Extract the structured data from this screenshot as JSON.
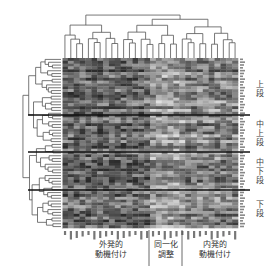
{
  "chart_data": {
    "type": "heatmap",
    "title": "",
    "dendrogram_top": true,
    "dendrogram_left": true,
    "n_columns": 30,
    "n_rows": 60,
    "column_groups": [
      {
        "label": "外発的\n動機付け",
        "span": [
          0,
          15
        ]
      },
      {
        "label": "同一化\n調整",
        "span": [
          15,
          21
        ]
      },
      {
        "label": "内発的\n動機付け",
        "span": [
          21,
          30
        ]
      }
    ],
    "row_segments": [
      {
        "label": "上\n段",
        "rows": [
          0,
          16
        ]
      },
      {
        "label": "中\n上\n段",
        "rows": [
          16,
          30
        ]
      },
      {
        "label": "中\n下\n段",
        "rows": [
          30,
          45
        ]
      },
      {
        "label": "下\n段",
        "rows": [
          45,
          60
        ]
      }
    ],
    "colorscale": [
      "#2a2a2a",
      "#e8e8e8"
    ],
    "legend": "none"
  },
  "labels": {
    "group1": "外発的\n動機付け",
    "group2": "同一化\n調整",
    "group3": "内発的\n動機付け",
    "seg1": "上\n段",
    "seg2": "中\n上\n段",
    "seg3": "中\n下\n段",
    "seg4": "下\n段"
  }
}
